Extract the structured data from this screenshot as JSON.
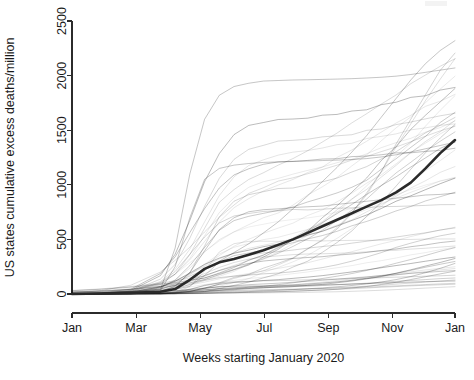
{
  "chart_data": {
    "type": "line",
    "title": "",
    "subtitle": "",
    "xlabel": "Weeks starting January 2020",
    "ylabel": "US states cumulative excess deaths/million",
    "xlim": [
      0,
      52
    ],
    "ylim": [
      0,
      2500
    ],
    "grid": false,
    "legend": null,
    "x_tick_positions": [
      0,
      8.7,
      17.4,
      26.1,
      34.8,
      43.5,
      52
    ],
    "x_tick_labels": [
      "Jan",
      "Mar",
      "May",
      "Jul",
      "Sep",
      "Nov",
      "Jan"
    ],
    "y_ticks": [
      0,
      500,
      1000,
      1500,
      2000,
      2500
    ],
    "y_tick_labels": [
      "0",
      "500",
      "1000",
      "1500",
      "2000",
      "2500"
    ],
    "x": [
      0,
      4,
      8,
      12,
      14,
      16,
      18,
      20,
      22,
      24,
      26,
      28,
      30,
      32,
      34,
      36,
      38,
      40,
      42,
      44,
      46,
      48,
      50,
      52
    ],
    "series": [
      {
        "name": "US mean",
        "emphasis": "bold",
        "color": "#2a2a2a",
        "values": [
          0,
          5,
          10,
          20,
          45,
          130,
          230,
          290,
          320,
          360,
          400,
          450,
          500,
          560,
          620,
          680,
          740,
          800,
          860,
          930,
          1020,
          1150,
          1290,
          1410
        ]
      },
      {
        "name": "outlier-high-spring",
        "emphasis": "faint",
        "values": [
          0,
          3,
          8,
          40,
          420,
          1100,
          1600,
          1820,
          1900,
          1930,
          1950,
          1955,
          1960,
          1962,
          1965,
          1968,
          1972,
          1978,
          1985,
          1995,
          2010,
          2030,
          2050,
          2070
        ]
      },
      {
        "name": "outlier-high-spring-2",
        "emphasis": "faint",
        "values": [
          0,
          2,
          6,
          30,
          250,
          700,
          1050,
          1150,
          1180,
          1195,
          1205,
          1210,
          1215,
          1218,
          1222,
          1226,
          1232,
          1240,
          1255,
          1275,
          1300,
          1330,
          1360,
          1390
        ]
      },
      {
        "name": "highest-year-end",
        "emphasis": "faint",
        "values": [
          0,
          4,
          12,
          30,
          60,
          130,
          220,
          300,
          380,
          460,
          560,
          660,
          780,
          900,
          1030,
          1160,
          1300,
          1450,
          1620,
          1790,
          1960,
          2110,
          2230,
          2320
        ]
      },
      {
        "name": "lowest-flat",
        "emphasis": "faint",
        "values": [
          0,
          1,
          2,
          3,
          4,
          6,
          10,
          14,
          18,
          22,
          28,
          34,
          40,
          48,
          56,
          66,
          78,
          92,
          110,
          132,
          160,
          195,
          235,
          280
        ]
      }
    ],
    "n_series_total": 51
  },
  "figure": {
    "plot_area": {
      "left_px": 72,
      "right_px": 455,
      "top_px": 21,
      "bottom_px": 294,
      "x_axis_y_px": 313
    }
  }
}
